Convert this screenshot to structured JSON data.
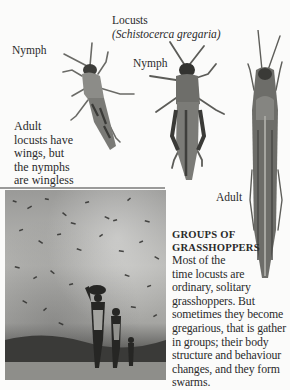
{
  "page": {
    "header": {
      "title": "Locusts",
      "scientific_name": "(Schistocerca gregaria)"
    },
    "specimen_labels": {
      "nymph_small": "Nymph",
      "nymph_large": "Nymph",
      "adult": "Adult"
    },
    "wings_caption": {
      "lines": [
        "Adult",
        "locusts have",
        "wings, but",
        "the nymphs",
        "are wingless"
      ]
    },
    "swarm_section": {
      "heading_lines": [
        "GROUPS OF",
        "GRASSHOPPERS"
      ],
      "body_lines": [
        "Most of the",
        "time locusts are",
        "ordinary, solitary",
        "grasshoppers. But",
        "sometimes they become",
        "gregarious, that is gather",
        "in groups; their body",
        "structure and behaviour",
        "changes, and they form",
        "swarms."
      ]
    },
    "photo": {
      "subject": "locust-swarm-with-people-walking"
    }
  }
}
